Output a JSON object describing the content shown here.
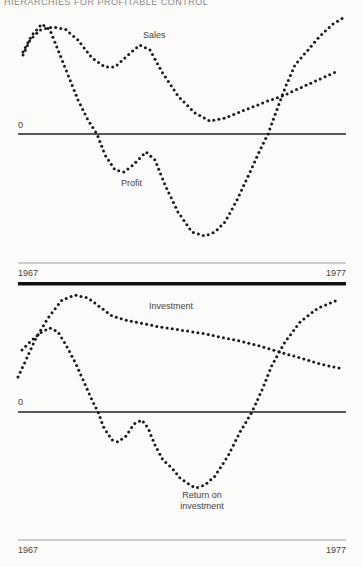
{
  "header": {
    "text": "HIERARCHIES FOR PROFITABLE CONTROL"
  },
  "chart_data": [
    {
      "type": "line",
      "title": "",
      "xlabel": "",
      "ylabel": "",
      "x_range": [
        "1967",
        "1977"
      ],
      "tick_labels": {
        "start": "1967",
        "end": "1977"
      },
      "zero_label": "0",
      "grid": false,
      "style": "dotted",
      "series": [
        {
          "name": "Sales",
          "label_pos": [
            143,
            38
          ],
          "points": [
            [
              23,
              55
            ],
            [
              30,
              40
            ],
            [
              40,
              30
            ],
            [
              52,
              27
            ],
            [
              65,
              29
            ],
            [
              78,
              40
            ],
            [
              92,
              58
            ],
            [
              105,
              67
            ],
            [
              115,
              67
            ],
            [
              128,
              55
            ],
            [
              140,
              45
            ],
            [
              150,
              50
            ],
            [
              162,
              72
            ],
            [
              178,
              96
            ],
            [
              195,
              113
            ],
            [
              210,
              121
            ],
            [
              225,
              118
            ],
            [
              245,
              110
            ],
            [
              265,
              102
            ],
            [
              285,
              95
            ],
            [
              300,
              88
            ],
            [
              320,
              79
            ],
            [
              338,
              71
            ]
          ]
        },
        {
          "name": "Profit",
          "label_pos": [
            121,
            186
          ],
          "points": [
            [
              23,
              52
            ],
            [
              32,
              35
            ],
            [
              42,
              24
            ],
            [
              50,
              30
            ],
            [
              58,
              50
            ],
            [
              68,
              75
            ],
            [
              78,
              100
            ],
            [
              88,
              120
            ],
            [
              97,
              134
            ],
            [
              105,
              155
            ],
            [
              115,
              170
            ],
            [
              124,
              172
            ],
            [
              133,
              165
            ],
            [
              146,
              152
            ],
            [
              155,
              160
            ],
            [
              165,
              185
            ],
            [
              178,
              212
            ],
            [
              192,
              232
            ],
            [
              205,
              236
            ],
            [
              215,
              232
            ],
            [
              225,
              222
            ],
            [
              237,
              200
            ],
            [
              250,
              172
            ],
            [
              260,
              150
            ],
            [
              268,
              134
            ],
            [
              276,
              112
            ],
            [
              285,
              88
            ],
            [
              295,
              65
            ],
            [
              308,
              50
            ],
            [
              320,
              36
            ],
            [
              333,
              24
            ],
            [
              343,
              18
            ]
          ]
        }
      ]
    },
    {
      "type": "line",
      "title": "",
      "xlabel": "",
      "ylabel": "",
      "x_range": [
        "1967",
        "1977"
      ],
      "tick_labels": {
        "start": "1967",
        "end": "1977"
      },
      "zero_label": "0",
      "grid": false,
      "style": "dotted",
      "series": [
        {
          "name": "Investment",
          "label_pos": [
            149,
            309
          ],
          "points": [
            [
              18,
              377
            ],
            [
              25,
              362
            ],
            [
              35,
              340
            ],
            [
              48,
              318
            ],
            [
              62,
              300
            ],
            [
              75,
              295
            ],
            [
              88,
              298
            ],
            [
              100,
              307
            ],
            [
              112,
              316
            ],
            [
              125,
              320
            ],
            [
              140,
              323
            ],
            [
              160,
              327
            ],
            [
              180,
              330
            ],
            [
              200,
              333
            ],
            [
              220,
              337
            ],
            [
              240,
              341
            ],
            [
              260,
              346
            ],
            [
              280,
              352
            ],
            [
              300,
              358
            ],
            [
              320,
              364
            ],
            [
              343,
              369
            ]
          ]
        },
        {
          "name": "Return on investment",
          "label_lines": [
            "Return on",
            "investment"
          ],
          "label_pos": [
            202,
            498
          ],
          "points": [
            [
              22,
              350
            ],
            [
              30,
              342
            ],
            [
              40,
              333
            ],
            [
              50,
              328
            ],
            [
              58,
              332
            ],
            [
              66,
              345
            ],
            [
              75,
              362
            ],
            [
              84,
              382
            ],
            [
              92,
              400
            ],
            [
              98,
              412
            ],
            [
              104,
              428
            ],
            [
              112,
              440
            ],
            [
              118,
              442
            ],
            [
              126,
              436
            ],
            [
              134,
              424
            ],
            [
              142,
              420
            ],
            [
              148,
              428
            ],
            [
              155,
              445
            ],
            [
              163,
              460
            ],
            [
              172,
              468
            ],
            [
              180,
              478
            ],
            [
              190,
              485
            ],
            [
              196,
              488
            ],
            [
              205,
              485
            ],
            [
              215,
              476
            ],
            [
              228,
              456
            ],
            [
              240,
              432
            ],
            [
              252,
              412
            ],
            [
              262,
              390
            ],
            [
              272,
              365
            ],
            [
              285,
              342
            ],
            [
              300,
              322
            ],
            [
              318,
              308
            ],
            [
              338,
              300
            ]
          ]
        }
      ]
    }
  ],
  "colors": {
    "dot": "#1a1a1a",
    "axis": "#222222",
    "thin_axis": "#555555",
    "background": "#fbfbf9"
  }
}
